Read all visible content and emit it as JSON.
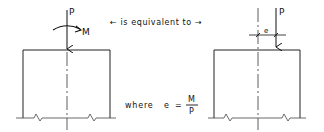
{
  "diagram": {
    "equivalence_text": "← is equivalent to →",
    "left": {
      "force_label": "P",
      "moment_label": "M"
    },
    "right": {
      "force_label": "P",
      "eccentricity_label": "e"
    },
    "formula": {
      "prefix": "where",
      "lhs": "e",
      "equals": "=",
      "numerator": "M",
      "denominator": "P"
    },
    "colors": {
      "ink": "#111111",
      "background": "#ffffff"
    }
  }
}
